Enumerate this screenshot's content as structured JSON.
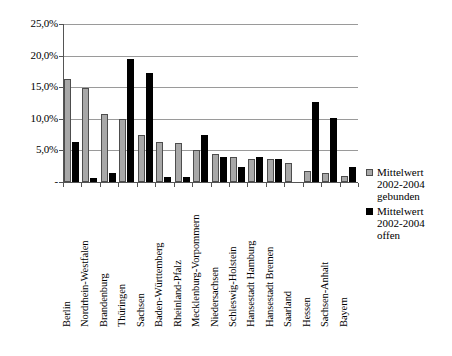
{
  "chart_data": {
    "type": "bar",
    "title": "",
    "subtitle": "",
    "xlabel": "",
    "ylabel": "",
    "ylim": [
      0,
      25
    ],
    "ytick_labels": [
      "25,0%",
      "20,0%",
      "15,0%",
      "10,0%",
      "5,0%",
      "-"
    ],
    "ytick_values": [
      25,
      20,
      15,
      10,
      5,
      0
    ],
    "grid": true,
    "legend_position": "right",
    "categories": [
      "Berlin",
      "Nordrhein-Westfalen",
      "Brandenburg",
      "Thüringen",
      "Sachsen",
      "Baden-Württemberg",
      "Rheinland-Pfalz",
      "Mecklenburg-Vorpommern",
      "Niedersachsen",
      "Schleswig-Holstein",
      "Hansestadt Hamburg",
      "Hansestadt Bremen",
      "Saarland",
      "Hessen",
      "Sachsen-Anhalt",
      "Bayern"
    ],
    "series": [
      {
        "name": "Mittelwert 2002-2004 gebunden",
        "color": "#a8a8a8",
        "values": [
          16.3,
          14.8,
          10.8,
          10.0,
          7.5,
          6.4,
          6.2,
          5.1,
          4.5,
          4.0,
          3.6,
          3.7,
          3.0,
          1.8,
          1.5,
          0.9
        ]
      },
      {
        "name": "Mittelwert 2002-2004 offen",
        "color": "#000000",
        "values": [
          6.4,
          0.6,
          1.5,
          19.5,
          17.2,
          0.8,
          0.8,
          7.4,
          4.0,
          2.3,
          3.9,
          3.7,
          0.0,
          12.7,
          10.2,
          2.4
        ]
      }
    ]
  },
  "legend": {
    "entries": [
      {
        "swatch": "gebunden",
        "line1": "Mittelwert",
        "line2": "2002-2004",
        "line3": "gebunden"
      },
      {
        "swatch": "offen",
        "line1": "Mittelwert",
        "line2": "2002-2004",
        "line3": "offen"
      }
    ]
  }
}
